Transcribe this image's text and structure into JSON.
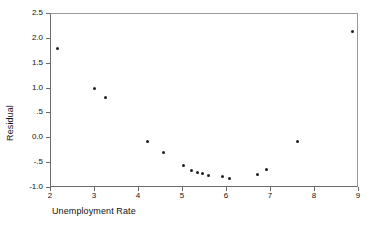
{
  "chart_data": {
    "type": "scatter",
    "title": "",
    "xlabel": "Unemployment Rate",
    "ylabel": "Residual",
    "xlim": [
      2,
      9
    ],
    "ylim": [
      -1.0,
      2.5
    ],
    "grid": false,
    "legend": null,
    "xticks": [
      2,
      3,
      4,
      5,
      6,
      7,
      8,
      9
    ],
    "xtick_labels": [
      "2",
      "3",
      "4",
      "5",
      "6",
      "7",
      "8",
      "9"
    ],
    "yticks": [
      -1.0,
      -0.5,
      0.0,
      0.5,
      1.0,
      1.5,
      2.0,
      2.5
    ],
    "ytick_labels": [
      "-1.0",
      "-.5",
      "0.0",
      ".5",
      "1.0",
      "1.5",
      "2.0",
      "2.5"
    ],
    "marker": "filled-circle",
    "marker_color": "#202020",
    "points": [
      {
        "x": 2.15,
        "y": 1.8
      },
      {
        "x": 2.98,
        "y": 1.0
      },
      {
        "x": 3.23,
        "y": 0.82
      },
      {
        "x": 4.2,
        "y": -0.07
      },
      {
        "x": 4.55,
        "y": -0.28
      },
      {
        "x": 5.0,
        "y": -0.55
      },
      {
        "x": 5.2,
        "y": -0.65
      },
      {
        "x": 5.32,
        "y": -0.68
      },
      {
        "x": 5.45,
        "y": -0.7
      },
      {
        "x": 5.58,
        "y": -0.75
      },
      {
        "x": 5.9,
        "y": -0.77
      },
      {
        "x": 6.05,
        "y": -0.8
      },
      {
        "x": 6.7,
        "y": -0.72
      },
      {
        "x": 6.9,
        "y": -0.62
      },
      {
        "x": 7.6,
        "y": -0.06
      },
      {
        "x": 8.85,
        "y": 2.15
      }
    ]
  },
  "colors": {
    "background": "#ffffff",
    "axis": "#6b6b6b",
    "frame": "#9a9a9a",
    "marker": "#202020",
    "text": "#111111"
  }
}
